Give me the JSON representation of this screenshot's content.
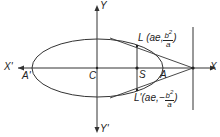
{
  "diagram": {
    "type": "ellipse-latus-rectum",
    "labels": {
      "y_axis_top": "Y",
      "y_axis_bottom": "Y'",
      "x_axis_left": "X'",
      "x_axis_right": "X",
      "center": "C",
      "focus": "S",
      "vertex_right": "A",
      "vertex_left": "A'",
      "latus_upper_name": "L",
      "latus_upper_coord_prefix": "(ae,",
      "latus_upper_num": "b",
      "latus_upper_num_exp": "2",
      "latus_upper_den": "a",
      "latus_upper_suffix": ")",
      "latus_lower_name": "L'",
      "latus_lower_coord_prefix": "(ae,",
      "latus_lower_sign": "−",
      "latus_lower_num": "b",
      "latus_lower_num_exp": "2",
      "latus_lower_den": "a",
      "latus_lower_suffix": ")"
    },
    "colors": {
      "stroke": "#333333",
      "text": "#222222"
    }
  }
}
